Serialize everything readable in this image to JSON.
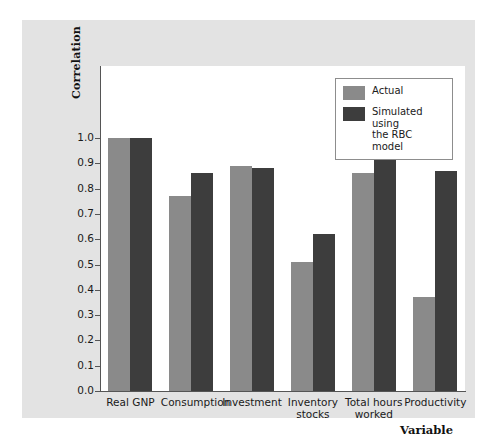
{
  "chart_data": {
    "type": "bar",
    "title": "",
    "xlabel": "Variable",
    "ylabel": "Correlation",
    "ylim": [
      0.0,
      1.0
    ],
    "grid": false,
    "legend_position": "top-right",
    "categories": [
      "Real GNP",
      "Consumption",
      "Investment",
      "Inventory stocks",
      "Total hours worked",
      "Productivity"
    ],
    "category_lines": [
      [
        "Real GNP"
      ],
      [
        "Consumption"
      ],
      [
        "Investment"
      ],
      [
        "Inventory",
        "stocks"
      ],
      [
        "Total hours",
        "worked"
      ],
      [
        "Productivity"
      ]
    ],
    "series": [
      {
        "name": "Actual",
        "color": "#8a8a8a",
        "values": [
          1.0,
          0.77,
          0.89,
          0.51,
          0.86,
          0.37
        ]
      },
      {
        "name": "Simulated using the RBC model",
        "color": "#3d3d3d",
        "values": [
          1.0,
          0.86,
          0.88,
          0.62,
          0.95,
          0.87
        ]
      }
    ],
    "ytick_labels": [
      "1.0",
      "0.9",
      "0.8",
      "0.7",
      "0.6",
      "0.5",
      "0.4",
      "0.3",
      "0.2",
      "0.1",
      "0.0"
    ],
    "ytick_values": [
      1.0,
      0.9,
      0.8,
      0.7,
      0.6,
      0.5,
      0.4,
      0.3,
      0.2,
      0.1,
      0.0
    ]
  },
  "legend": {
    "entries": [
      {
        "label": "Actual",
        "color": "#8a8a8a"
      },
      {
        "label": "Simulated using\nthe RBC model",
        "label_line1": "Simulated using",
        "label_line2": "the RBC model",
        "color": "#3d3d3d"
      }
    ]
  },
  "colors": {
    "page_background": "#ffffff",
    "panel_background": "#e3e3e3",
    "plot_background": "#ffffff",
    "axis": "#555555",
    "actual_bar": "#8a8a8a",
    "simulated_bar": "#3d3d3d",
    "text": "#1a1a1a"
  }
}
